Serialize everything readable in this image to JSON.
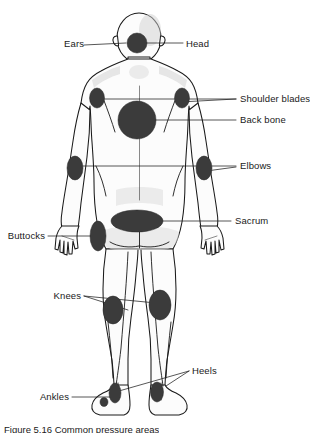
{
  "figure": {
    "view": "posterior",
    "caption": "Figure 5.16 Common pressure areas",
    "colors": {
      "spot": "#3b3b3b",
      "outline": "#1a1a1a",
      "background": "#ffffff",
      "leader": "#1f1f1f"
    }
  },
  "labels": {
    "ears": "Ears",
    "head": "Head",
    "shoulder_blades": "Shoulder blades",
    "back_bone": "Back bone",
    "elbows": "Elbows",
    "sacrum": "Sacrum",
    "buttocks": "Buttocks",
    "knees": "Knees",
    "heels": "Heels",
    "ankles": "Ankles"
  },
  "pressure_points": [
    {
      "id": "head",
      "label": "Head",
      "shape": "circle",
      "side": "center"
    },
    {
      "id": "ears",
      "label": "Ears",
      "shape": "none",
      "side": "both"
    },
    {
      "id": "shoulder-left",
      "label": "Shoulder blades",
      "shape": "oval",
      "side": "left"
    },
    {
      "id": "shoulder-right",
      "label": "Shoulder blades",
      "shape": "oval",
      "side": "right"
    },
    {
      "id": "back-bone",
      "label": "Back bone",
      "shape": "circle",
      "side": "center"
    },
    {
      "id": "elbow-left",
      "label": "Elbows",
      "shape": "oval",
      "side": "left"
    },
    {
      "id": "elbow-right",
      "label": "Elbows",
      "shape": "oval",
      "side": "right"
    },
    {
      "id": "sacrum",
      "label": "Sacrum",
      "shape": "oval",
      "side": "center"
    },
    {
      "id": "buttock-left",
      "label": "Buttocks",
      "shape": "oval",
      "side": "left"
    },
    {
      "id": "knee-left",
      "label": "Knees",
      "shape": "oval",
      "side": "left"
    },
    {
      "id": "knee-right",
      "label": "Knees",
      "shape": "oval",
      "side": "right"
    },
    {
      "id": "heel-left",
      "label": "Heels",
      "shape": "oval",
      "side": "left"
    },
    {
      "id": "heel-right",
      "label": "Heels",
      "shape": "oval",
      "side": "right"
    },
    {
      "id": "ankle-left",
      "label": "Ankles",
      "shape": "oval",
      "side": "left"
    }
  ]
}
